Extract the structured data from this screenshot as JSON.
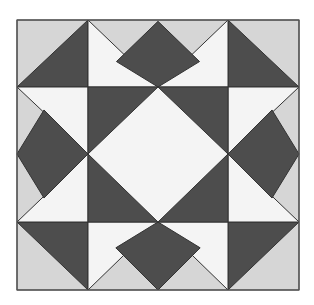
{
  "colors": {
    "background": "#ffffff",
    "light_gray": "#d6d6d6",
    "dark": "#4d4d4d",
    "white": "#f4f4f4",
    "stroke": "#333333"
  },
  "grid": {
    "x": [
      17,
      88,
      158,
      228,
      299
    ],
    "y": [
      20,
      87,
      154,
      222,
      290
    ]
  },
  "pattern_name": "Star quilt block"
}
